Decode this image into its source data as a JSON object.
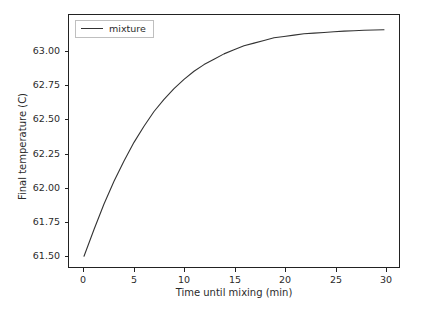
{
  "chart_data": {
    "type": "line",
    "title": "",
    "xlabel": "Time until mixing (min)",
    "ylabel": "Final temperature (C)",
    "xlim": [
      -1.5,
      31.5
    ],
    "ylim": [
      61.4,
      63.28
    ],
    "xticks": [
      0,
      5,
      10,
      15,
      20,
      25,
      30
    ],
    "xtick_labels": [
      "0",
      "5",
      "10",
      "15",
      "20",
      "25",
      "30"
    ],
    "yticks": [
      61.5,
      61.75,
      62.0,
      62.25,
      62.5,
      62.75,
      63.0
    ],
    "ytick_labels": [
      "61.50",
      "61.75",
      "62.00",
      "62.25",
      "62.50",
      "62.75",
      "63.00"
    ],
    "grid": false,
    "legend_position": "upper left",
    "series": [
      {
        "name": "mixture",
        "color": "#333333",
        "x": [
          0,
          1,
          2,
          3,
          4,
          5,
          6,
          7,
          8,
          9,
          10,
          11,
          12,
          13,
          14,
          15,
          16,
          17,
          18,
          19,
          20,
          21,
          22,
          23,
          24,
          25,
          26,
          27,
          28,
          29,
          30
        ],
        "y": [
          61.48,
          61.68,
          61.87,
          62.04,
          62.19,
          62.33,
          62.45,
          62.56,
          62.65,
          62.73,
          62.8,
          62.86,
          62.91,
          62.95,
          62.99,
          63.02,
          63.05,
          63.07,
          63.09,
          63.11,
          63.12,
          63.13,
          63.14,
          63.145,
          63.15,
          63.155,
          63.16,
          63.163,
          63.166,
          63.168,
          63.17
        ]
      }
    ]
  },
  "legend": {
    "entries": [
      {
        "label": "mixture"
      }
    ]
  }
}
